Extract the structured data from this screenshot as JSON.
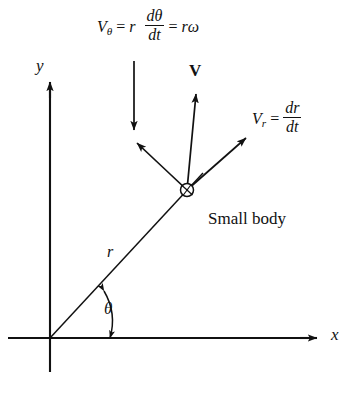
{
  "figure": {
    "background_color": "#ffffff",
    "stroke_color": "#111111"
  },
  "axes": {
    "x_label": "x",
    "y_label": "y",
    "origin": {
      "x": 50,
      "y": 338
    }
  },
  "labels": {
    "v_theta": {
      "symbol": "V",
      "subscript": "θ",
      "equals": "=",
      "radius_symbol": "r",
      "fraction_numerator": "dθ",
      "fraction_denominator": "dt",
      "equals2": "=",
      "result": "rω",
      "full_text": "Vθ = r dθ/dt = rω"
    },
    "v_r": {
      "symbol": "V",
      "subscript": "r",
      "equals": "=",
      "fraction_numerator": "dr",
      "fraction_denominator": "dt",
      "full_text": "Vr = dr/dt"
    },
    "v_vector": "V",
    "small_body": "Small body",
    "radius": "r",
    "theta": "θ"
  },
  "vectors": [
    {
      "name": "V_theta",
      "from": {
        "x": 187,
        "y": 190
      },
      "to": {
        "x": 136,
        "y": 142
      }
    },
    {
      "name": "V",
      "from": {
        "x": 187,
        "y": 190
      },
      "to": {
        "x": 196,
        "y": 93
      }
    },
    {
      "name": "V_r",
      "from": {
        "x": 187,
        "y": 190
      },
      "to": {
        "x": 247,
        "y": 137
      }
    }
  ],
  "body_marker": {
    "x": 187,
    "y": 190,
    "radius": 6.5
  },
  "leader_arrow": {
    "from": {
      "x": 134,
      "y": 61
    },
    "to": {
      "x": 134,
      "y": 131
    }
  },
  "angle_arc": {
    "start_angle_deg": 0,
    "end_angle_deg": 47,
    "radius": 60,
    "double_headed": true
  }
}
